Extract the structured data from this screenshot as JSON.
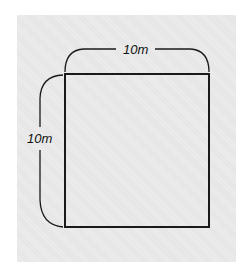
{
  "diagram": {
    "shape": "square",
    "top_dimension_label": "10m",
    "left_dimension_label": "10m",
    "colors": {
      "background": "#e4e4e4",
      "stroke": "#1a1a1a"
    }
  }
}
